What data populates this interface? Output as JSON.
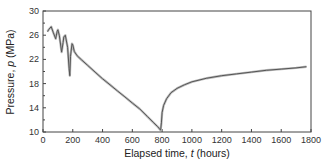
{
  "chart_data": {
    "type": "line",
    "title": "",
    "xlabel": "Elapsed time, t (hours)",
    "xlabel_parts": [
      "Elapsed time, ",
      "t",
      " (hours)"
    ],
    "ylabel": "Pressure, p (MPa)",
    "ylabel_parts": [
      "Pressure, ",
      "p",
      " (MPa)"
    ],
    "xlim": [
      0,
      1800
    ],
    "ylim": [
      10,
      30
    ],
    "xticks": [
      0,
      200,
      400,
      600,
      800,
      1000,
      1200,
      1400,
      1600,
      1800
    ],
    "yticks": [
      10,
      14,
      18,
      22,
      26,
      30
    ],
    "grid": false,
    "legend": null,
    "series": [
      {
        "name": "pressure",
        "color": "#555555",
        "x": [
          30,
          40,
          55,
          70,
          85,
          95,
          100,
          110,
          125,
          135,
          140,
          150,
          165,
          175,
          180,
          185,
          195,
          200,
          210,
          230,
          260,
          300,
          350,
          400,
          450,
          500,
          550,
          600,
          650,
          700,
          740,
          770,
          790,
          795,
          800,
          810,
          830,
          860,
          900,
          950,
          1000,
          1100,
          1200,
          1300,
          1400,
          1500,
          1600,
          1700,
          1770
        ],
        "y": [
          26.6,
          27.0,
          27.4,
          26.4,
          25.4,
          26.6,
          26.9,
          25.9,
          23.2,
          24.8,
          25.7,
          26.0,
          24.0,
          20.5,
          19.3,
          22.5,
          24.6,
          24.4,
          23.3,
          22.6,
          21.9,
          21.0,
          19.9,
          18.8,
          17.8,
          16.8,
          15.8,
          14.8,
          13.8,
          12.6,
          11.6,
          10.9,
          10.3,
          11.5,
          13.2,
          14.4,
          15.5,
          16.5,
          17.2,
          17.8,
          18.3,
          18.9,
          19.3,
          19.6,
          19.9,
          20.2,
          20.4,
          20.6,
          20.8
        ]
      }
    ]
  }
}
